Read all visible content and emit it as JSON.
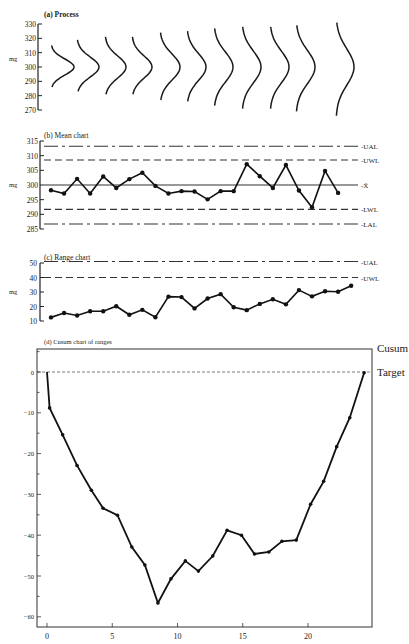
{
  "chart_data": [
    {
      "id": "process",
      "type": "line",
      "title": "(a) Process",
      "ylabel": "mg",
      "yticks": [
        270,
        280,
        290,
        300,
        310,
        320,
        330
      ],
      "ylim": [
        270,
        330
      ],
      "description": "Sequence of 11 normal distribution curves centred at 300 mg with increasing spread",
      "distributions": [
        {
          "mean": 300,
          "low": 286,
          "high": 315,
          "peak_width": 23
        },
        {
          "mean": 300,
          "low": 283,
          "high": 319,
          "peak_width": 22
        },
        {
          "mean": 300,
          "low": 281,
          "high": 321,
          "peak_width": 21
        },
        {
          "mean": 300,
          "low": 281,
          "high": 321,
          "peak_width": 20
        },
        {
          "mean": 300,
          "low": 277,
          "high": 324,
          "peak_width": 20
        },
        {
          "mean": 300,
          "low": 276,
          "high": 325,
          "peak_width": 19
        },
        {
          "mean": 300,
          "low": 273,
          "high": 327,
          "peak_width": 19
        },
        {
          "mean": 300,
          "low": 271,
          "high": 328,
          "peak_width": 19
        },
        {
          "mean": 300,
          "low": 271,
          "high": 328,
          "peak_width": 19
        },
        {
          "mean": 300,
          "low": 269,
          "high": 329,
          "peak_width": 19
        },
        {
          "mean": 300,
          "low": 266,
          "high": 331,
          "peak_width": 18
        }
      ]
    },
    {
      "id": "mean",
      "type": "line",
      "title": "(b) Mean chart",
      "ylabel": "mg",
      "yticks": [
        285,
        290,
        295,
        300,
        305,
        310,
        315
      ],
      "ylim": [
        285,
        315
      ],
      "reference_lines": [
        {
          "label": "UAL",
          "value": 313.2,
          "style": "dashdot"
        },
        {
          "label": "UWL",
          "value": 308.5,
          "style": "dashed"
        },
        {
          "label": "X̄",
          "value": 300,
          "style": "solid"
        },
        {
          "label": "LWL",
          "value": 291.7,
          "style": "dashed"
        },
        {
          "label": "LAL",
          "value": 286.7,
          "style": "dashdot"
        }
      ],
      "x": [
        1,
        2,
        3,
        4,
        5,
        6,
        7,
        8,
        9,
        10,
        11,
        12,
        13,
        14,
        15,
        16,
        17,
        18,
        19,
        20,
        21,
        22,
        23,
        24
      ],
      "values": [
        298.2,
        297.1,
        302.1,
        297.1,
        302.9,
        299.0,
        302.0,
        304.2,
        299.7,
        297.1,
        297.9,
        297.8,
        295.1,
        297.9,
        297.9,
        307.1,
        303.0,
        299.0,
        306.8,
        298.1,
        292.4,
        304.8,
        297.3
      ]
    },
    {
      "id": "range",
      "type": "line",
      "title": "(c) Range chart",
      "ylabel": "mg",
      "yticks": [
        10,
        20,
        30,
        40,
        50
      ],
      "ylim": [
        10,
        50
      ],
      "reference_lines": [
        {
          "label": "UAL",
          "value": 51,
          "style": "dashdot"
        },
        {
          "label": "UWL",
          "value": 40,
          "style": "dashed"
        }
      ],
      "values": [
        12.5,
        15.5,
        13.8,
        16.7,
        16.7,
        20.2,
        14.3,
        17.7,
        12.6,
        26.8,
        26.5,
        18.7,
        25.5,
        28.5,
        19.5,
        17.5,
        21.8,
        25.0,
        21.5,
        31.3,
        27.0,
        30.5,
        30.2,
        34.3
      ]
    },
    {
      "id": "cusum",
      "type": "line",
      "title": "(d) Cusum chart of ranges",
      "ylabel": "Cusum",
      "target_label": "Target",
      "target_value": 0,
      "xticks": [
        0,
        5,
        10,
        15,
        20
      ],
      "yticks": [
        0,
        -10,
        -20,
        -30,
        -40,
        -50,
        -60
      ],
      "xlim": [
        -0.3,
        24.8
      ],
      "ylim": [
        -62.5,
        5.5
      ],
      "x": [
        0,
        0.2,
        1.2,
        2.3,
        3.4,
        4.3,
        5.4,
        6.5,
        7.5,
        8.5,
        9.5,
        10.6,
        11.6,
        12.7,
        13.8,
        14.9,
        15.9,
        17.0,
        18.0,
        19.1,
        20.2,
        21.2,
        22.2,
        23.2,
        24.3
      ],
      "values": [
        0,
        -8.8,
        -15.4,
        -22.9,
        -29.0,
        -33.4,
        -35.1,
        -42.9,
        -47.3,
        -56.6,
        -50.7,
        -46.3,
        -48.8,
        -45.1,
        -38.8,
        -40.0,
        -44.6,
        -44.1,
        -41.5,
        -41.2,
        -32.4,
        -26.8,
        -18.3,
        -11.2,
        -0.2
      ]
    }
  ]
}
